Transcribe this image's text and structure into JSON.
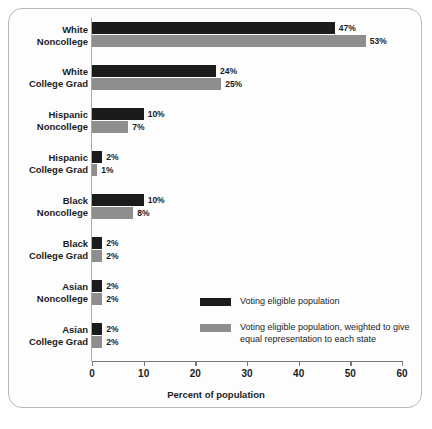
{
  "chart_data": {
    "type": "bar",
    "orientation": "horizontal",
    "title": "",
    "xlabel": "Percent of population",
    "ylabel": "",
    "xlim": [
      0,
      60
    ],
    "xticks": [
      0,
      10,
      20,
      30,
      40,
      50,
      60
    ],
    "xtick_labels": [
      "0",
      "10",
      "20",
      "30",
      "40",
      "50",
      "60"
    ],
    "grid": false,
    "legend_position": "center-right",
    "categories": [
      "White\nNoncollege",
      "White\nCollege Grad",
      "Hispanic\nNoncollege",
      "Hispanic\nCollege Grad",
      "Black\nNoncollege",
      "Black\nCollege Grad",
      "Asian\nNoncollege",
      "Asian\nCollege Grad"
    ],
    "category_lines": [
      [
        "White",
        "Noncollege"
      ],
      [
        "White",
        "College Grad"
      ],
      [
        "Hispanic",
        "Noncollege"
      ],
      [
        "Hispanic",
        "College Grad"
      ],
      [
        "Black",
        "Noncollege"
      ],
      [
        "Black",
        "College Grad"
      ],
      [
        "Asian",
        "Noncollege"
      ],
      [
        "Asian",
        "College Grad"
      ]
    ],
    "series": [
      {
        "name": "Voting eligible population",
        "color": "#1b1b1b",
        "values": [
          47,
          24,
          10,
          2,
          10,
          2,
          2,
          2
        ],
        "labels": [
          "47%",
          "24%",
          "10%",
          "2%",
          "10%",
          "2%",
          "2%",
          "2%"
        ]
      },
      {
        "name": "Voting eligible population, weighted to give equal representation to each state",
        "color": "#8e8e8e",
        "values": [
          53,
          25,
          7,
          1,
          8,
          2,
          2,
          2
        ],
        "labels": [
          "53%",
          "25%",
          "7%",
          "1%",
          "8%",
          "2%",
          "2%",
          "2%"
        ]
      }
    ]
  },
  "legend": {
    "items": [
      {
        "label": "Voting eligible population"
      },
      {
        "label": "Voting eligible population, weighted to give equal representation to each state"
      }
    ]
  }
}
